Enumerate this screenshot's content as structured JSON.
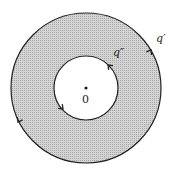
{
  "diagram": {
    "type": "annulus-contour",
    "colors": {
      "fill": "#c8c8c8",
      "stroke": "#222222",
      "background": "#ffffff"
    },
    "center": {
      "x": 86,
      "y": 88
    },
    "outer_radius": 75,
    "inner_radius": 32,
    "origin_label": "0",
    "outer_contour_label": "q′",
    "inner_contour_label": "q″",
    "arrow_direction": "counterclockwise"
  }
}
